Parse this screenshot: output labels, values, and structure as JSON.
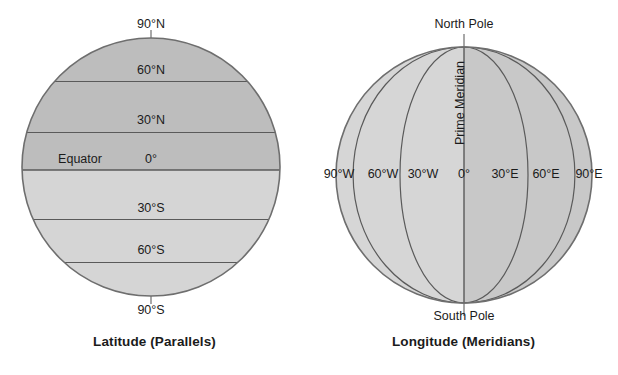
{
  "figures": [
    {
      "id": "latitude",
      "caption": "Latitude (Parallels)",
      "pole_top_label": "90°N",
      "pole_bottom_label": "90°S",
      "equator_name": "Equator",
      "parallels": [
        {
          "label": "90°N",
          "value": 90
        },
        {
          "label": "60°N",
          "value": 60
        },
        {
          "label": "30°N",
          "value": 30
        },
        {
          "label": "0°",
          "value": 0
        },
        {
          "label": "30°S",
          "value": -30
        },
        {
          "label": "60°S",
          "value": -60
        },
        {
          "label": "90°S",
          "value": -90
        }
      ]
    },
    {
      "id": "longitude",
      "caption": "Longitude (Meridians)",
      "pole_top_label": "North Pole",
      "pole_bottom_label": "South Pole",
      "prime_meridian_name": "Prime Meridian",
      "meridians": [
        {
          "label": "90°W",
          "value": -90
        },
        {
          "label": "60°W",
          "value": -60
        },
        {
          "label": "30°W",
          "value": -30
        },
        {
          "label": "0°",
          "value": 0
        },
        {
          "label": "30°E",
          "value": 30
        },
        {
          "label": "60°E",
          "value": 60
        },
        {
          "label": "90°E",
          "value": 90
        }
      ]
    }
  ],
  "colors": {
    "background": "#ffffff",
    "globe_dark": "#bdbdbd",
    "globe_light": "#d5d5d5",
    "globe_east": "#c8c8c8",
    "globe_west": "#d6d6d6",
    "outline": "#6e6e6e",
    "line": "#5a5a5a",
    "text": "#1b1b1b"
  }
}
